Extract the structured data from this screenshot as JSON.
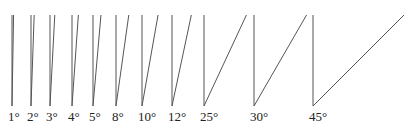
{
  "diagram": {
    "title": "",
    "baseline_y": 106,
    "top_y": 15,
    "label_y": 121,
    "line_color": "#555555",
    "angles": [
      {
        "label": "1°",
        "degrees": 1,
        "x": 12
      },
      {
        "label": "2°",
        "degrees": 2,
        "x": 31
      },
      {
        "label": "3°",
        "degrees": 3,
        "x": 50
      },
      {
        "label": "4°",
        "degrees": 4,
        "x": 72
      },
      {
        "label": "5°",
        "degrees": 5,
        "x": 93
      },
      {
        "label": "8°",
        "degrees": 8,
        "x": 116
      },
      {
        "label": "10°",
        "degrees": 10,
        "x": 142
      },
      {
        "label": "12°",
        "degrees": 12,
        "x": 172
      },
      {
        "label": "25°",
        "degrees": 25,
        "x": 204
      },
      {
        "label": "30°",
        "degrees": 30,
        "x": 254
      },
      {
        "label": "45°",
        "degrees": 45,
        "x": 313
      }
    ]
  }
}
